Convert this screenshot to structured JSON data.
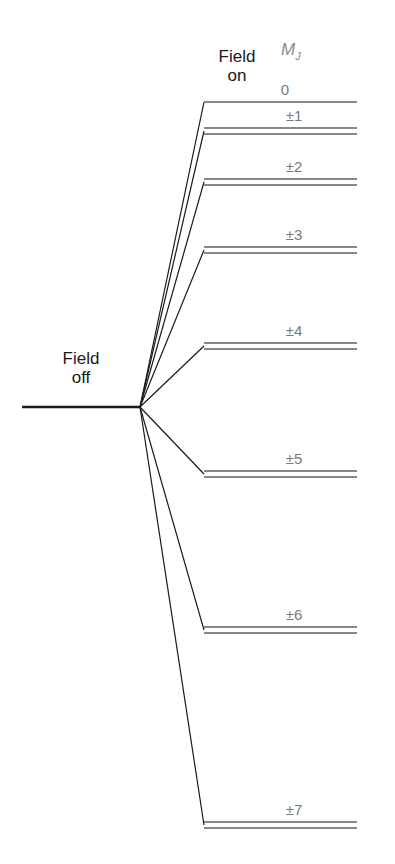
{
  "labels": {
    "field_off_line1": "Field",
    "field_off_line2": "off",
    "field_on_line1": "Field",
    "field_on_line2": "on",
    "mj_symbol": "M",
    "mj_subscript": "J"
  },
  "colors": {
    "connector": "#1a1a1a",
    "level": "#888888",
    "label": "#7a7a7a"
  },
  "field_off_level": {
    "x1": 22,
    "x2": 140,
    "y": 407
  },
  "field_on_levels": [
    {
      "mj": "0",
      "doublet": false,
      "y": 102
    },
    {
      "mj": "±1",
      "doublet": true,
      "y": 128
    },
    {
      "mj": "±2",
      "doublet": true,
      "y": 179
    },
    {
      "mj": "±3",
      "doublet": true,
      "y": 247
    },
    {
      "mj": "±4",
      "doublet": true,
      "y": 343
    },
    {
      "mj": "±5",
      "doublet": true,
      "y": 471
    },
    {
      "mj": "±6",
      "doublet": true,
      "y": 627
    },
    {
      "mj": "±7",
      "doublet": true,
      "y": 822
    }
  ]
}
